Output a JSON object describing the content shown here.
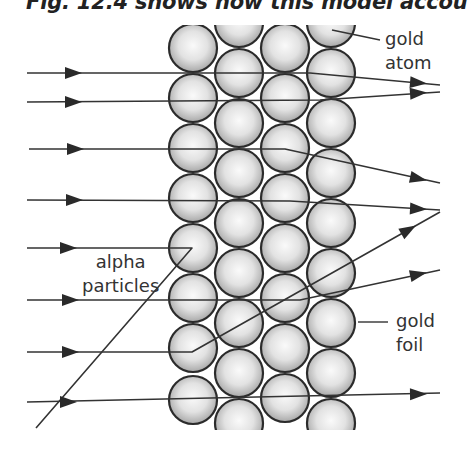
{
  "caption": "Fig. 12.4 shows how this model accou",
  "labels": {
    "gold_atom_line1": "gold",
    "gold_atom_line2": "atom",
    "alpha_line1": "alpha",
    "alpha_line2": "particles",
    "gold_foil_line1": "gold",
    "gold_foil_line2": "foil"
  },
  "colors": {
    "atom_center": "#fafafa",
    "atom_edge": "#a8a8a8",
    "atom_border": "#2b2b2b",
    "path_line": "#333333",
    "label_text": "#333333"
  },
  "foil": {
    "clip": {
      "x": 160,
      "y": 25,
      "width": 200,
      "height": 405
    },
    "radius": 24,
    "columns": [
      {
        "x": 193,
        "ys": [
          48,
          98,
          148,
          198,
          248,
          298,
          348,
          400
        ]
      },
      {
        "x": 239,
        "ys": [
          23,
          73,
          123,
          173,
          223,
          273,
          323,
          373,
          423
        ]
      },
      {
        "x": 285,
        "ys": [
          48,
          98,
          148,
          198,
          248,
          298,
          348,
          398
        ]
      },
      {
        "x": 331,
        "ys": [
          23,
          73,
          123,
          173,
          223,
          273,
          323,
          373,
          423
        ]
      }
    ]
  },
  "particle_paths": [
    {
      "id": "path-1",
      "points": [
        [
          27,
          73
        ],
        [
          310,
          73
        ],
        [
          440,
          85
        ]
      ],
      "arrows": [
        [
          75,
          73,
          0
        ],
        [
          420,
          83,
          5
        ]
      ],
      "behavior": "slight deflection down"
    },
    {
      "id": "path-2",
      "points": [
        [
          27,
          102
        ],
        [
          320,
          100
        ],
        [
          440,
          92
        ]
      ],
      "arrows": [
        [
          75,
          102,
          0
        ],
        [
          420,
          93,
          -4
        ]
      ],
      "behavior": "slight deflection up"
    },
    {
      "id": "path-3",
      "points": [
        [
          29,
          149
        ],
        [
          285,
          149
        ],
        [
          440,
          183
        ]
      ],
      "arrows": [
        [
          77,
          149,
          0
        ],
        [
          420,
          179,
          12
        ]
      ],
      "behavior": "deflected down"
    },
    {
      "id": "path-4",
      "points": [
        [
          27,
          200
        ],
        [
          290,
          201
        ],
        [
          440,
          210
        ]
      ],
      "arrows": [
        [
          76,
          200,
          0
        ],
        [
          420,
          209,
          3
        ]
      ],
      "behavior": "near straight"
    },
    {
      "id": "path-5",
      "points": [
        [
          27,
          248
        ],
        [
          192,
          248
        ],
        [
          36,
          428
        ]
      ],
      "arrows": [
        [
          70,
          248,
          0
        ]
      ],
      "behavior": "reflected back"
    },
    {
      "id": "path-6",
      "points": [
        [
          27,
          300
        ],
        [
          300,
          300
        ],
        [
          440,
          270
        ]
      ],
      "arrows": [
        [
          72,
          300,
          0
        ],
        [
          420,
          274,
          -12
        ]
      ],
      "behavior": "slight deflection up"
    },
    {
      "id": "path-7",
      "points": [
        [
          27,
          352
        ],
        [
          192,
          352
        ],
        [
          440,
          212
        ]
      ],
      "arrows": [
        [
          72,
          352,
          0
        ],
        [
          410,
          229,
          -30
        ]
      ],
      "behavior": "strongly deflected up"
    },
    {
      "id": "path-8",
      "points": [
        [
          27,
          402
        ],
        [
          440,
          393
        ]
      ],
      "arrows": [
        [
          70,
          402,
          0
        ],
        [
          420,
          394,
          -1
        ]
      ],
      "behavior": "straight through"
    }
  ],
  "leaders": {
    "gold_atom": [
      [
        332,
        30
      ],
      [
        380,
        40
      ]
    ],
    "gold_foil": [
      [
        358,
        322
      ],
      [
        388,
        322
      ]
    ]
  }
}
